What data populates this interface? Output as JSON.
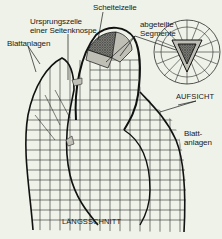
{
  "diagram": {
    "background": "#eef2e8",
    "line_color": "#1a1a1a",
    "segment_fill": "#bfbfb6",
    "apical_cell_fill": "#6e6e6e",
    "labels": {
      "scheitelzelle": "Scheitelzelle",
      "ursprungszelle_1": "Ursprungszelle",
      "ursprungszelle_2": "einer Seitenknospe",
      "blattanlagen_left": "Blattanlagen",
      "abgeteilte_1": "abgeteilte",
      "abgeteilte_2": "Segmente",
      "aufsicht": "AUFSICHT",
      "blatt_right_1": "Blatt-",
      "blatt_right_2": "anlagen",
      "laengsschnitt": "LÄNGSSCHNITT"
    }
  }
}
